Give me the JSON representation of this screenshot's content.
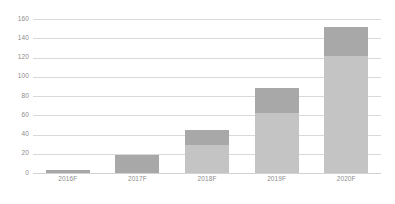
{
  "chart_data": {
    "type": "bar",
    "title": "",
    "subtitle": "",
    "xlabel": "",
    "ylabel": "",
    "categories": [
      "2016F",
      "2017F",
      "2018F",
      "2019F",
      "2020F"
    ],
    "values": [
      3,
      19,
      45,
      88,
      152
    ],
    "series": [
      {
        "name": "lower-segment",
        "values": [
          3,
          19,
          29,
          62,
          122
        ]
      },
      {
        "name": "upper-segment",
        "values": [
          0,
          0,
          16,
          26,
          30
        ]
      }
    ],
    "ylim": [
      0,
      160
    ],
    "ytick_labels": [
      "0",
      "20",
      "40",
      "60",
      "80",
      "100",
      "120",
      "140",
      "160"
    ],
    "ytick_values": [
      0,
      20,
      40,
      60,
      80,
      100,
      120,
      140,
      160
    ],
    "grid": true,
    "legend": "none",
    "colors": {
      "bar_upper": "#a8a8a8",
      "bar_lower": "#c4c4c4",
      "gridline": "#d9d9d9",
      "axis": "#d2d2d2",
      "tick_text": "#8c8c8c",
      "background": "#ffffff"
    }
  }
}
